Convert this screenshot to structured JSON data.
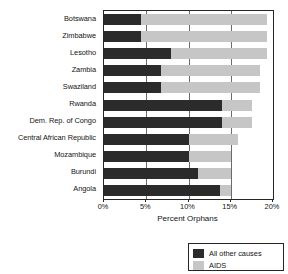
{
  "chart_data": {
    "type": "bar",
    "orientation": "horizontal",
    "stacked": true,
    "title": "",
    "xlabel": "Percent Orphans",
    "ylabel": "",
    "xlim": [
      0,
      20
    ],
    "xticks": [
      0,
      5,
      10,
      15,
      20
    ],
    "xtick_labels": [
      "0%",
      "5%",
      "10%",
      "15%",
      "20%"
    ],
    "grid": true,
    "legend_position": "bottom-right",
    "categories": [
      "Botswana",
      "Zimbabwe",
      "Lesotho",
      "Zambia",
      "Swaziland",
      "Rwanda",
      "Dem. Rep. of Congo",
      "Central African Republic",
      "Mozambique",
      "Burundi",
      "Angola"
    ],
    "series": [
      {
        "name": "All other causes",
        "color": "#2b2b2b",
        "values": [
          4.4,
          4.4,
          7.9,
          6.7,
          6.7,
          14.0,
          14.0,
          10.0,
          10.0,
          11.1,
          13.7
        ]
      },
      {
        "name": "AIDS",
        "color": "#c6c6c6",
        "values": [
          14.9,
          14.9,
          11.4,
          11.8,
          11.8,
          3.5,
          3.5,
          5.8,
          5.0,
          3.9,
          1.3
        ]
      }
    ],
    "totals": [
      19.3,
      19.3,
      19.3,
      18.5,
      18.5,
      17.5,
      17.5,
      15.8,
      15.0,
      15.0,
      15.0
    ]
  },
  "legend": {
    "items": [
      {
        "label": "All other causes",
        "color": "#2b2b2b"
      },
      {
        "label": "AIDS",
        "color": "#c6c6c6"
      }
    ]
  }
}
